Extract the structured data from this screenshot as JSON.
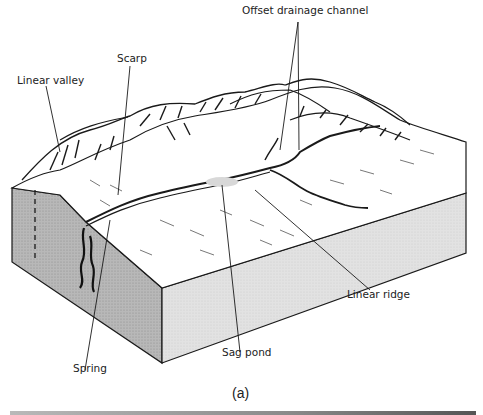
{
  "figure": {
    "caption": "(a)",
    "labels": {
      "offset_drainage_channel": "Offset drainage channel",
      "scarp": "Scarp",
      "linear_valley": "Linear valley",
      "linear_ridge": "Linear ridge",
      "sag_pond": "Sag pond",
      "spring": "Spring"
    },
    "colors": {
      "line": "#1a1a1a",
      "block_side_dark": "#a8a8a8",
      "block_side_light": "#dcdcdc",
      "background": "#ffffff"
    }
  }
}
